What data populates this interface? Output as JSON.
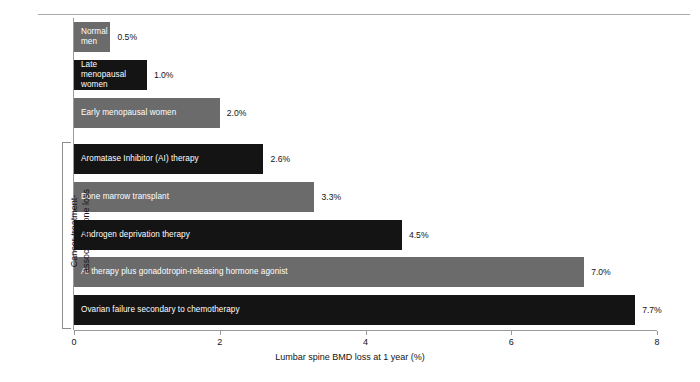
{
  "chart_data": {
    "type": "bar",
    "orientation": "horizontal",
    "title": "",
    "xlabel": "Lumbar spine BMD loss at 1 year (%)",
    "ylabel": "",
    "xlim": [
      0,
      8
    ],
    "xticks": [
      "0",
      "2",
      "4",
      "6",
      "8"
    ],
    "xtick_values": [
      0,
      2,
      4,
      6,
      8
    ],
    "grid": false,
    "legend": "none",
    "categories": [
      "Normal\nmen",
      "Late menopausal\nwomen",
      "Early menopausal women",
      "Aromatase Inhibitor (AI) therapy",
      "Bone marrow transplant",
      "Androgen deprivation therapy",
      "AI therapy plus gonadotropin-releasing hormone agonist",
      "Ovarian failure secondary to chemotherapy"
    ],
    "values": [
      0.5,
      1.0,
      2.0,
      2.6,
      3.3,
      4.5,
      7.0,
      7.7
    ],
    "value_labels": [
      "0.5%",
      "1.0%",
      "2.0%",
      "2.6%",
      "3.3%",
      "4.5%",
      "7.0%",
      "7.7%"
    ],
    "bar_colors": [
      "#6b6b6b",
      "#141414",
      "#6b6b6b",
      "#141414",
      "#6b6b6b",
      "#141414",
      "#6b6b6b",
      "#141414"
    ],
    "annotations": [
      {
        "name": "group-bracket",
        "text": "Cancer treatment-\nassociated bone loss",
        "covers_categories": [
          3,
          4,
          5,
          6,
          7
        ]
      }
    ]
  },
  "axis": {
    "x_title": "Lumbar spine BMD loss at 1 year (%)",
    "ticks": [
      {
        "label": "0",
        "value": 0
      },
      {
        "label": "2",
        "value": 2
      },
      {
        "label": "4",
        "value": 4
      },
      {
        "label": "6",
        "value": 6
      },
      {
        "label": "8",
        "value": 8
      }
    ]
  },
  "bracket": {
    "label": "Cancer treatment-\nassociated bone loss"
  },
  "bars": [
    {
      "label": "Normal\nmen",
      "value": 0.5,
      "value_label": "0.5%",
      "color": "#6b6b6b"
    },
    {
      "label": "Late menopausal\nwomen",
      "value": 1.0,
      "value_label": "1.0%",
      "color": "#141414"
    },
    {
      "label": "Early menopausal women",
      "value": 2.0,
      "value_label": "2.0%",
      "color": "#6b6b6b"
    },
    {
      "label": "Aromatase Inhibitor (AI) therapy",
      "value": 2.6,
      "value_label": "2.6%",
      "color": "#141414"
    },
    {
      "label": "Bone marrow transplant",
      "value": 3.3,
      "value_label": "3.3%",
      "color": "#6b6b6b"
    },
    {
      "label": "Androgen deprivation therapy",
      "value": 4.5,
      "value_label": "4.5%",
      "color": "#141414"
    },
    {
      "label": "AI therapy plus gonadotropin-releasing hormone agonist",
      "value": 7.0,
      "value_label": "7.0%",
      "color": "#6b6b6b"
    },
    {
      "label": "Ovarian failure secondary to chemotherapy",
      "value": 7.7,
      "value_label": "7.7%",
      "color": "#141414"
    }
  ]
}
